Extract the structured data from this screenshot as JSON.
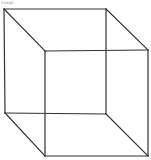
{
  "label": "Image",
  "stroke_color": "#333333",
  "background": "#ffffff",
  "figure": {
    "type": "wireframe-cube",
    "vertices": {
      "back_top_left": [
        4,
        9
      ],
      "back_top_right": [
        106,
        9
      ],
      "back_bottom_left": [
        5,
        113
      ],
      "back_bottom_right": [
        106,
        114
      ],
      "front_top_left": [
        45,
        51
      ],
      "front_top_right": [
        148,
        50
      ],
      "front_bottom_left": [
        45,
        156
      ],
      "front_bottom_right": [
        148,
        156
      ]
    }
  }
}
